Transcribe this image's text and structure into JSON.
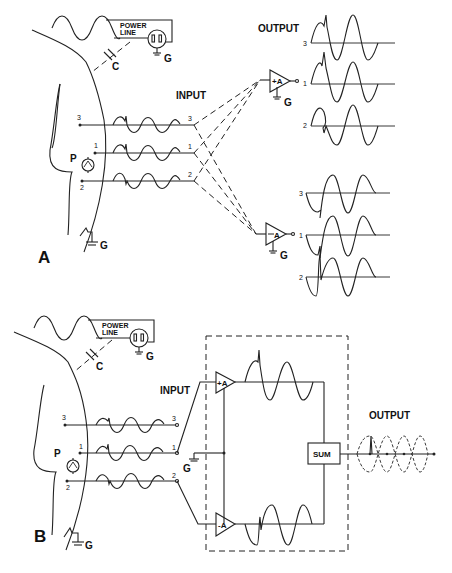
{
  "figure": {
    "panel_a": {
      "label": "A",
      "power_line": "POWER",
      "power_line_2": "LINE",
      "capacitor": "C",
      "ground": "G",
      "patient": "P",
      "input_label": "INPUT",
      "output_label": "OUTPUT",
      "lead_labels": [
        "3",
        "1",
        "2"
      ],
      "amp_plus": "+A",
      "amp_minus": "A",
      "output_trace_labels_top": [
        "3",
        "1",
        "2"
      ],
      "output_trace_labels_bottom": [
        "3",
        "1",
        "2"
      ]
    },
    "panel_b": {
      "label": "B",
      "power_line": "POWER",
      "power_line_2": "LINE",
      "capacitor": "C",
      "ground": "G",
      "patient": "P",
      "input_label": "INPUT",
      "output_label": "OUTPUT",
      "lead_labels": [
        "3",
        "1",
        "2"
      ],
      "amp_plus": "+A",
      "amp_minus": "-A",
      "sum_label": "SUM"
    }
  }
}
